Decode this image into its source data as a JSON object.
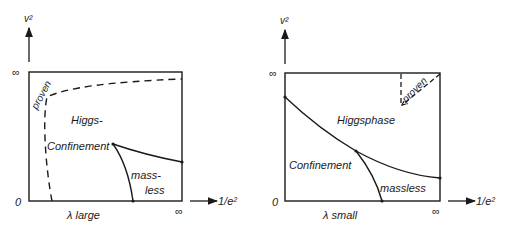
{
  "left_panel": {
    "y_axis_label": "v²",
    "x_axis_label": "1/e²",
    "y_top_tick": "∞",
    "y_origin_tick": "0",
    "x_right_tick": "∞",
    "caption": "λ large",
    "regions": {
      "higgs": "Higgs-",
      "confinement": "Confinement",
      "massless_1": "mass-",
      "massless_2": "less",
      "proven": "proven"
    }
  },
  "right_panel": {
    "y_axis_label": "v²",
    "x_axis_label": "1/e²",
    "y_top_tick": "∞",
    "y_origin_tick": "0",
    "x_right_tick": "∞",
    "caption": "λ small",
    "regions": {
      "higgs": "Higgsphase",
      "confinement": "Confinement",
      "massless": "massless",
      "proven": "proven"
    }
  }
}
